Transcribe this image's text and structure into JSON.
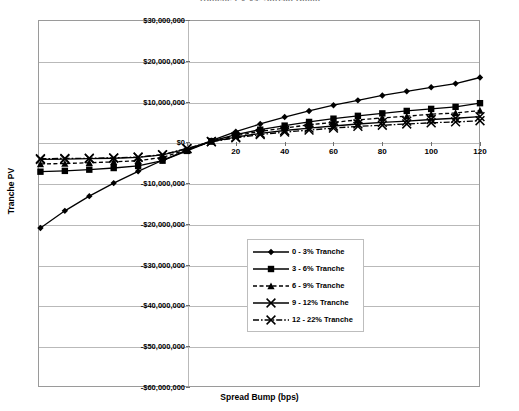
{
  "chart_data": {
    "type": "line",
    "title": "Tranche PV vs. Spread Bump",
    "xlabel": "Spread Bump (bps)",
    "ylabel": "Tranche PV",
    "xlim": [
      -61,
      120
    ],
    "ylim": [
      -60000000,
      30000000
    ],
    "grid": true,
    "legend_position": "inside-center",
    "x_ticks": [
      0,
      20,
      40,
      60,
      80,
      100,
      120
    ],
    "x_tick_labels": [
      "0",
      "20",
      "40",
      "60",
      "80",
      "100",
      "120"
    ],
    "y_ticks": [
      30000000,
      20000000,
      10000000,
      0,
      -10000000,
      -20000000,
      -30000000,
      -40000000,
      -50000000,
      -60000000
    ],
    "y_tick_labels": [
      "$30,000,000",
      "$20,000,000",
      "$10,000,000",
      "$0",
      "-$10,000,000",
      "-$20,000,000",
      "-$30,000,000",
      "-$40,000,000",
      "-$50,000,000",
      "-$60,000,000"
    ],
    "x": [
      -60,
      -50,
      -40,
      -30,
      -20,
      -10,
      0,
      10,
      20,
      30,
      40,
      50,
      60,
      70,
      80,
      90,
      100,
      110,
      120
    ],
    "series": [
      {
        "name": "0 - 3% Tranche",
        "marker": "diamond",
        "linestyle": "solid",
        "color": "#000000",
        "values": [
          -21000000,
          -16800000,
          -13200000,
          -10000000,
          -7100000,
          -4400000,
          -1900000,
          400000,
          2600000,
          4500000,
          6200000,
          7700000,
          9100000,
          10300000,
          11500000,
          12500000,
          13500000,
          14400000,
          15900000
        ]
      },
      {
        "name": "3 - 6% Tranche",
        "marker": "square",
        "linestyle": "solid",
        "color": "#000000",
        "values": [
          -7200000,
          -7000000,
          -6700000,
          -6300000,
          -5800000,
          -4500000,
          -2100000,
          300000,
          1900000,
          3100000,
          4100000,
          5000000,
          5800000,
          6500000,
          7100000,
          7700000,
          8200000,
          8700000,
          9600000
        ]
      },
      {
        "name": "6 - 9% Tranche",
        "marker": "triangle",
        "linestyle": "dashed",
        "color": "#000000",
        "values": [
          -5300000,
          -5200000,
          -5000000,
          -4800000,
          -4500000,
          -3700000,
          -1800000,
          200000,
          1600000,
          2700000,
          3500000,
          4300000,
          4900000,
          5500000,
          6000000,
          6400000,
          6900000,
          7200000,
          7800000
        ]
      },
      {
        "name": "9 - 12% Tranche",
        "marker": "x",
        "linestyle": "solid-x",
        "color": "#000000",
        "values": [
          -4200000,
          -4100000,
          -4000000,
          -3900000,
          -3700000,
          -3100000,
          -1600000,
          200000,
          1300000,
          2200000,
          2900000,
          3500000,
          4000000,
          4500000,
          4900000,
          5200000,
          5600000,
          5900000,
          6300000
        ]
      },
      {
        "name": "12 - 22% Tranche",
        "marker": "x",
        "linestyle": "dashdot",
        "color": "#000000",
        "values": [
          -4000000,
          -3950000,
          -3900000,
          -3800000,
          -3600000,
          -3000000,
          -1500000,
          150000,
          1100000,
          1900000,
          2500000,
          3000000,
          3500000,
          3900000,
          4200000,
          4500000,
          4800000,
          5000000,
          5300000
        ]
      }
    ]
  }
}
